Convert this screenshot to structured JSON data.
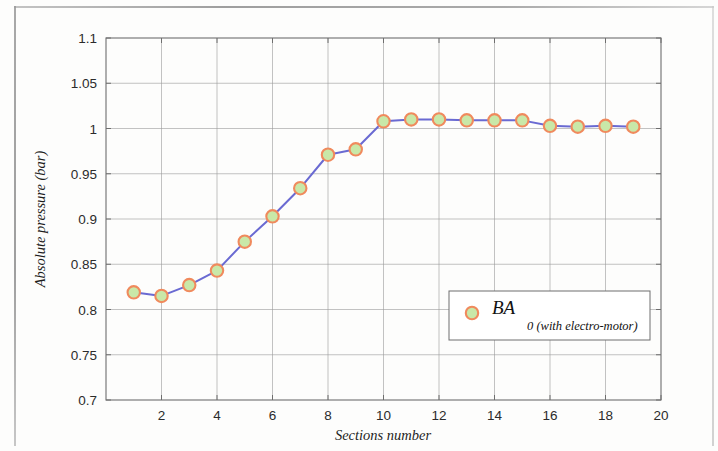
{
  "chart_data": {
    "type": "line",
    "title": "",
    "xlabel": "Sections number",
    "ylabel": "Absolute pressure (bar)",
    "xlim": [
      0,
      20
    ],
    "ylim": [
      0.7,
      1.1
    ],
    "xticks": [
      2,
      4,
      6,
      8,
      10,
      12,
      14,
      16,
      18,
      20
    ],
    "xtick_labels": [
      "2",
      "4",
      "6",
      "8",
      "10",
      "12",
      "14",
      "16",
      "18",
      "20"
    ],
    "yticks": [
      0.7,
      0.75,
      0.8,
      0.85,
      0.9,
      0.95,
      1,
      1.05,
      1.1
    ],
    "ytick_labels": [
      "0.7",
      "0.75",
      "0.8",
      "0.85",
      "0.9",
      "0.95",
      "1",
      "1.05",
      "1.1"
    ],
    "grid": true,
    "legend_position": "center-right",
    "series": [
      {
        "name": "BA",
        "name_subscript": "0 (with electro-motor)",
        "legend_label": "BA0 (with electro-motor)",
        "line_color": "#6a6ad2",
        "marker_edge_color": "#f08a5d",
        "marker_face_color": "#c9e8a8",
        "marker": "circle",
        "x": [
          1,
          2,
          3,
          4,
          5,
          6,
          7,
          8,
          9,
          10,
          11,
          12,
          13,
          14,
          15,
          16,
          17,
          18,
          19
        ],
        "values": [
          0.819,
          0.815,
          0.827,
          0.843,
          0.875,
          0.903,
          0.934,
          0.971,
          0.977,
          1.008,
          1.01,
          1.01,
          1.009,
          1.009,
          1.009,
          1.003,
          1.002,
          1.003,
          1.002
        ]
      }
    ]
  },
  "axes": {
    "x_title": "Sections number",
    "y_title": "Absolute pressure (bar)"
  },
  "legend": {
    "label_main": "BA",
    "label_sub": "0 (with electro-motor)"
  },
  "colors": {
    "line": "#6a6ad2",
    "marker_ring": "#f08a5d",
    "marker_fill": "#c9e8a8",
    "grid": "#9a9a9a",
    "axis": "#6e6e6e",
    "text": "#1d1d1d",
    "page": "#fdfdfc"
  }
}
